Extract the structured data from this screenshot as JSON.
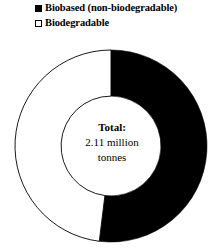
{
  "legend": {
    "items": [
      {
        "label": "Biobased (non-biodegradable)",
        "marker": "filled-square-icon",
        "color": "#000000"
      },
      {
        "label": "Biodegradable",
        "marker": "hollow-square-icon",
        "color": "#ffffff"
      }
    ]
  },
  "center": {
    "line1": "Total:",
    "line2": "2.11 million",
    "line3": "tonnes"
  },
  "chart_data": {
    "type": "pie",
    "variant": "donut",
    "title": "",
    "subtitle": "",
    "xlabel": "",
    "ylabel": "",
    "grid": false,
    "legend_position": "top-left",
    "total_label": "Total: 2.11 million tonnes",
    "total_value": 2.11,
    "total_units": "million tonnes",
    "start_angle_deg": 0,
    "direction": "clockwise",
    "inner_radius_ratio": 0.52,
    "categories": [
      "Biobased (non-biodegradable)",
      "Biodegradable"
    ],
    "values": [
      52,
      48
    ],
    "value_units": "percent",
    "colors": [
      "#000000",
      "#ffffff"
    ],
    "stroke_color": "#000000",
    "slices": [
      {
        "label": "Biobased (non-biodegradable)",
        "percent": 52,
        "value_million_tonnes": 1.1,
        "color": "#000000",
        "start_deg": 0,
        "end_deg": 187
      },
      {
        "label": "Biodegradable",
        "percent": 48,
        "value_million_tonnes": 1.01,
        "color": "#ffffff",
        "start_deg": 187,
        "end_deg": 360
      }
    ]
  }
}
